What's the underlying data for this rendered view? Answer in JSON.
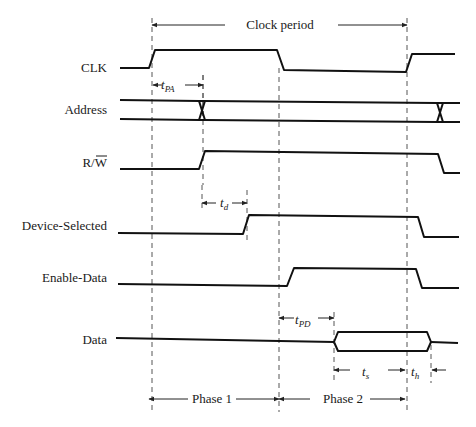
{
  "diagram": {
    "guides": [
      {
        "name": "guide-clock-rise-1",
        "x": 152,
        "y1": 18,
        "y2": 412
      },
      {
        "name": "guide-address-change",
        "x": 203,
        "y1": 75,
        "y2": 185
      },
      {
        "name": "guide-tpa-end",
        "x": 203,
        "y1": 75,
        "y2": 120
      },
      {
        "name": "guide-td-start",
        "x": 202,
        "y1": 185,
        "y2": 212
      },
      {
        "name": "guide-td-end",
        "x": 247,
        "y1": 190,
        "y2": 240
      },
      {
        "name": "guide-clock-fall",
        "x": 279,
        "y1": 68,
        "y2": 412
      },
      {
        "name": "guide-tpd-end",
        "x": 334,
        "y1": 312,
        "y2": 383
      },
      {
        "name": "guide-clock-rise-2",
        "x": 407,
        "y1": 18,
        "y2": 412
      },
      {
        "name": "guide-th-end",
        "x": 431,
        "y1": 345,
        "y2": 383
      }
    ],
    "signals": [
      {
        "name": "clk",
        "label": "CLK",
        "label_x": 107,
        "label_y": 72,
        "type": "line",
        "points": "120,68 149,68 155,50 277,50 284,70 406,72 412,54 455,54"
      },
      {
        "name": "address",
        "label": "Address",
        "label_x": 107,
        "label_y": 114,
        "type": "bus",
        "top": "120,100 199,101 205,101 437,103 443,103 460,103",
        "bottom": "120,119 199,120 205,120 437,122 443,122 460,122",
        "cross1": "199,101 205,120",
        "cross1b": "199,120 205,101",
        "cross2": "437,103 443,122",
        "cross2b": "437,122 443,103"
      },
      {
        "name": "rw",
        "label": "R/W",
        "label_bar": "W",
        "label_x": 107,
        "label_y": 167,
        "type": "line",
        "points": "120,169 199,169 205,151 438,154 444,173 460,173"
      },
      {
        "name": "device-selected",
        "label": "Device-Selected",
        "label_x": 107,
        "label_y": 230,
        "type": "line",
        "points": "118,233 243,234 249,215 418,217 424,237 459,237"
      },
      {
        "name": "enable-data",
        "label": "Enable-Data",
        "label_x": 107,
        "label_y": 282,
        "type": "line",
        "points": "118,284 287,286 294,268 416,269 422,288 459,288"
      },
      {
        "name": "data",
        "label": "Data",
        "label_x": 107,
        "label_y": 344,
        "type": "data",
        "points_left": "116,338 334,342",
        "window": "334,342 338,332 427,332 431,342 427,351 338,351 334,342",
        "points_right": "431,342 458,343"
      }
    ],
    "annotations": {
      "clock_period": {
        "label": "Clock period",
        "label_x": 280,
        "label_y": 29,
        "arrow_left": {
          "x1": 152,
          "x2": 225,
          "y": 25
        },
        "arrow_right": {
          "x1": 338,
          "x2": 407,
          "y": 25
        }
      },
      "tpa": {
        "main": "t",
        "sub": "PA",
        "x": 161,
        "y": 89,
        "arrow_left": {
          "x1": 153,
          "x2": 162,
          "y": 85
        },
        "arrow_right": {
          "x1": 185,
          "x2": 203,
          "y": 85
        }
      },
      "td": {
        "main": "t",
        "sub": "d",
        "x": 220,
        "y": 207,
        "arrow_left": {
          "x1": 202,
          "x2": 216,
          "y": 203
        },
        "arrow_right": {
          "x1": 232,
          "x2": 247,
          "y": 203
        }
      },
      "tpd": {
        "main": "t",
        "sub": "PD",
        "x": 295,
        "y": 324,
        "arrow_left": {
          "x1": 279,
          "x2": 294,
          "y": 318
        },
        "arrow_right": {
          "x1": 318,
          "x2": 334,
          "y": 318
        }
      },
      "ts": {
        "main": "t",
        "sub": "s",
        "x": 362,
        "y": 376,
        "arrow_left": {
          "x1": 334,
          "x2": 350,
          "y": 370
        },
        "arrow_right": {
          "x1": 388,
          "x2": 405,
          "y": 370
        }
      },
      "th": {
        "main": "t",
        "sub": "h",
        "x": 411,
        "y": 376,
        "arrow_right_inward": {
          "x1": 446,
          "x2": 432,
          "y": 370
        }
      },
      "phase1": {
        "label": "Phase 1",
        "label_x": 212,
        "label_y": 403,
        "arrow_left": {
          "x1": 149,
          "x2": 188,
          "y": 399
        },
        "arrow_right": {
          "x1": 236,
          "x2": 279,
          "y": 399
        }
      },
      "phase2": {
        "label": "Phase 2",
        "label_x": 343,
        "label_y": 403,
        "arrow_left": {
          "x1": 279,
          "x2": 310,
          "y": 399
        },
        "arrow_right": {
          "x1": 370,
          "x2": 405,
          "y": 399
        }
      }
    }
  }
}
